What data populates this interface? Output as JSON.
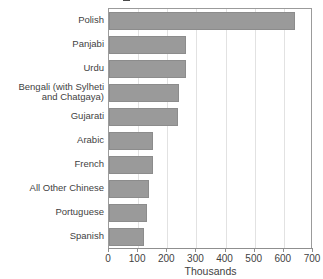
{
  "chart_data": {
    "type": "bar",
    "orientation": "horizontal",
    "title": "",
    "xlabel": "Thousands",
    "ylabel": "",
    "xlim": [
      0,
      700
    ],
    "xticks": [
      0,
      100,
      200,
      300,
      400,
      500,
      600,
      700
    ],
    "xtick_labels": [
      "0",
      "100",
      "200",
      "300",
      "400",
      "500",
      "600",
      "700"
    ],
    "grid": "vertical",
    "legend": "none",
    "bar_color": "#9a9a9a",
    "bar_edge_color": "#8c8c8c",
    "categories": [
      "Polish",
      "Panjabi",
      "Urdu",
      "Bengali (with Sylheti\nand Chatgaya)",
      "Gujarati",
      "Arabic",
      "French",
      "All Other Chinese",
      "Portuguese",
      "Spanish"
    ],
    "values": [
      638,
      264,
      264,
      240,
      238,
      152,
      150,
      137,
      130,
      120
    ]
  },
  "axis": {
    "x_title": "Thousands"
  }
}
